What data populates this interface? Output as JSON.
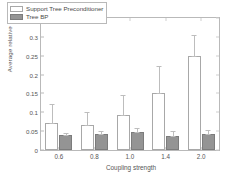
{
  "chart_data": {
    "type": "bar",
    "title": "",
    "xlabel": "Coupling strength",
    "ylabel": "Average relative error",
    "categories": [
      "0.6",
      "0.8",
      "1.0",
      "1.4",
      "2.0"
    ],
    "ylim": [
      0,
      0.35
    ],
    "yticks": [
      "0",
      "0.05",
      "0.1",
      "0.15",
      "0.2",
      "0.25",
      "0.3",
      "0.35"
    ],
    "ytick_values": [
      0,
      0.05,
      0.1,
      0.15,
      0.2,
      0.25,
      0.3,
      0.35
    ],
    "grid": false,
    "legend_position": "upper left",
    "series": [
      {
        "name": "Support Tree Preconditioner",
        "color": "#ffffff",
        "edge_color": "#a8a8a8",
        "values": [
          0.072,
          0.067,
          0.092,
          0.152,
          0.248
        ],
        "err_high": [
          0.122,
          0.101,
          0.145,
          0.222,
          0.305
        ]
      },
      {
        "name": "Tree BP",
        "color": "#949494",
        "edge_color": "#7c7c7c",
        "values": [
          0.039,
          0.042,
          0.049,
          0.038,
          0.042
        ],
        "err_high": [
          0.046,
          0.05,
          0.058,
          0.05,
          0.054
        ]
      }
    ]
  },
  "legend": {
    "items": [
      {
        "label": "Support Tree Preconditioner",
        "swatch": "light"
      },
      {
        "label": "Tree BP",
        "swatch": "dark"
      }
    ]
  }
}
